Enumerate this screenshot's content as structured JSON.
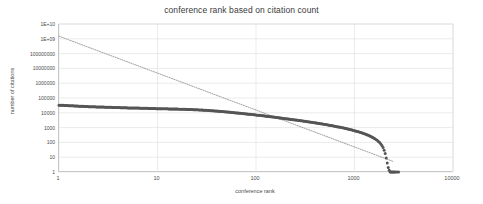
{
  "chart_data": {
    "type": "scatter",
    "title": "conference rank based on citation count",
    "xlabel": "conference rank",
    "ylabel": "number of citations",
    "xscale": "log",
    "yscale": "log",
    "xlim": [
      1,
      10000
    ],
    "ylim": [
      1,
      10000000000
    ],
    "grid": true,
    "legend": false,
    "legend_position": "none",
    "xticks": [
      "1",
      "10",
      "100",
      "1000",
      "10000"
    ],
    "xtick_values": [
      1,
      10,
      100,
      1000,
      10000
    ],
    "yticks": [
      "1",
      "10",
      "100",
      "1000",
      "10000",
      "100000",
      "1000000",
      "10000000",
      "100000000",
      "1E+09",
      "1E+10"
    ],
    "ytick_values": [
      1,
      10,
      100,
      1000,
      10000,
      100000,
      1000000,
      10000000,
      100000000,
      1000000000,
      10000000000
    ],
    "series": [
      {
        "name": "citation count by rank",
        "marker": "circle",
        "color": "#555555",
        "points": [
          [
            1,
            33000
          ],
          [
            2,
            26000
          ],
          [
            3,
            24000
          ],
          [
            4,
            22500
          ],
          [
            5,
            21500
          ],
          [
            6,
            21000
          ],
          [
            7,
            20500
          ],
          [
            8,
            20000
          ],
          [
            9,
            19500
          ],
          [
            10,
            19000
          ],
          [
            11,
            18800
          ],
          [
            12,
            18600
          ],
          [
            13,
            18400
          ],
          [
            14,
            18200
          ],
          [
            15,
            18000
          ],
          [
            16,
            17800
          ],
          [
            17,
            17600
          ],
          [
            18,
            17400
          ],
          [
            19,
            17200
          ],
          [
            20,
            17000
          ],
          [
            22,
            16600
          ],
          [
            25,
            16000
          ],
          [
            28,
            15400
          ],
          [
            30,
            15000
          ],
          [
            35,
            14000
          ],
          [
            40,
            13000
          ],
          [
            45,
            12200
          ],
          [
            50,
            11500
          ],
          [
            60,
            10200
          ],
          [
            70,
            9200
          ],
          [
            80,
            8400
          ],
          [
            90,
            7700
          ],
          [
            100,
            7100
          ],
          [
            120,
            6200
          ],
          [
            140,
            5500
          ],
          [
            160,
            4900
          ],
          [
            180,
            4400
          ],
          [
            200,
            4000
          ],
          [
            250,
            3300
          ],
          [
            300,
            2800
          ],
          [
            350,
            2400
          ],
          [
            400,
            2100
          ],
          [
            450,
            1850
          ],
          [
            500,
            1650
          ],
          [
            600,
            1320
          ],
          [
            700,
            1080
          ],
          [
            800,
            890
          ],
          [
            900,
            740
          ],
          [
            1000,
            620
          ],
          [
            1100,
            520
          ],
          [
            1200,
            430
          ],
          [
            1300,
            355
          ],
          [
            1400,
            290
          ],
          [
            1500,
            232
          ],
          [
            1600,
            182
          ],
          [
            1700,
            138
          ],
          [
            1800,
            98
          ],
          [
            1900,
            62
          ],
          [
            1950,
            45
          ],
          [
            2000,
            30
          ],
          [
            2050,
            18
          ],
          [
            2100,
            9
          ],
          [
            2150,
            4
          ],
          [
            2200,
            2
          ],
          [
            2250,
            1.3
          ],
          [
            2300,
            1
          ],
          [
            2400,
            1
          ],
          [
            2500,
            1
          ],
          [
            2600,
            1
          ],
          [
            2700,
            1
          ],
          [
            2800,
            1
          ]
        ]
      }
    ],
    "trendline": {
      "name": "power-law trendline",
      "style": "dotted",
      "color": "#8a8a8a",
      "start": [
        1,
        1500000000
      ],
      "end": [
        2500,
        5
      ]
    },
    "annotations": []
  }
}
